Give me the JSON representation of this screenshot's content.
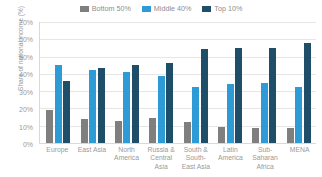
{
  "chart_data": {
    "type": "bar",
    "title": "",
    "subtitle": "",
    "xlabel": "",
    "ylabel": "Share of national income (%)",
    "ylim": [
      0,
      70
    ],
    "ytick_labels": [
      "70%",
      "60%",
      "50%",
      "40%",
      "30%",
      "20%",
      "10%",
      "0%"
    ],
    "ytick_values": [
      70,
      60,
      50,
      40,
      30,
      20,
      10,
      0
    ],
    "grid": true,
    "legend_position": "top-center",
    "categories": [
      "Europe",
      "East Asia",
      "North America",
      "Russia & Central Asia",
      "South & South-East Asia",
      "Latin America",
      "Sub-Saharan Africa",
      "MENA"
    ],
    "series": [
      {
        "name": "Bottom 50%",
        "color": "#7f7f7f",
        "values": [
          19.0,
          13.7,
          12.9,
          14.5,
          12.0,
          9.5,
          8.5,
          8.6
        ]
      },
      {
        "name": "Middle 40%",
        "color": "#2e9bd6",
        "values": [
          45.2,
          42.5,
          41.0,
          38.5,
          32.5,
          34.2,
          35.0,
          32.3
        ]
      },
      {
        "name": "Top 10%",
        "color": "#1f4e68",
        "values": [
          35.7,
          43.3,
          45.3,
          46.4,
          54.3,
          55.0,
          55.2,
          57.6
        ]
      }
    ]
  },
  "colors": {
    "bottom_50": "#7f7f7f",
    "middle_40": "#2e9bd6",
    "top_10": "#1f4e68",
    "gridline": "#e6e6e6",
    "axis": "#d9d9d9",
    "text": "#9a9a9a"
  }
}
